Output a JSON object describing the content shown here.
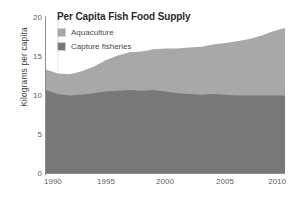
{
  "chart_data": {
    "type": "area",
    "stacked": true,
    "title": "Per Capita Fish Food Supply",
    "xlabel": "",
    "ylabel": "Kilograms per capita",
    "xlim": [
      1990,
      2010
    ],
    "ylim": [
      0,
      20
    ],
    "grid": false,
    "legend_position": "top-left",
    "x": [
      1990,
      1991,
      1992,
      1993,
      1994,
      1995,
      1996,
      1997,
      1998,
      1999,
      2000,
      2001,
      2002,
      2003,
      2004,
      2005,
      2006,
      2007,
      2008,
      2009,
      2010
    ],
    "xticks": [
      "1990",
      "1995",
      "2000",
      "2005",
      "2010"
    ],
    "yticks": [
      "0",
      "5",
      "10",
      "15",
      "20"
    ],
    "series": [
      {
        "name": "Capture fisheries",
        "color": "#787878",
        "values": [
          10.7,
          10.2,
          10.0,
          10.1,
          10.3,
          10.5,
          10.6,
          10.7,
          10.6,
          10.7,
          10.5,
          10.3,
          10.2,
          10.1,
          10.2,
          10.1,
          10.0,
          10.0,
          10.0,
          10.0,
          10.0
        ]
      },
      {
        "name": "Aquaculture",
        "color": "#a8a8a8",
        "values": [
          2.6,
          2.6,
          2.7,
          3.0,
          3.4,
          4.0,
          4.5,
          4.8,
          5.0,
          5.2,
          5.5,
          5.7,
          5.9,
          6.1,
          6.3,
          6.6,
          6.9,
          7.2,
          7.6,
          8.2,
          8.6
        ]
      }
    ],
    "totals": [
      13.3,
      12.8,
      12.7,
      13.1,
      13.7,
      14.5,
      15.1,
      15.5,
      15.6,
      15.9,
      16.0,
      16.0,
      16.1,
      16.2,
      16.5,
      16.7,
      16.9,
      17.2,
      17.6,
      18.2,
      18.6
    ]
  },
  "legend": {
    "items": [
      {
        "label": "Aquaculture",
        "color": "#a8a8a8"
      },
      {
        "label": "Capture fisheries",
        "color": "#787878"
      }
    ]
  }
}
